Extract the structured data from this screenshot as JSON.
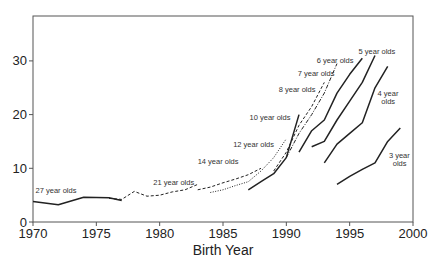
{
  "chart_data": {
    "type": "line",
    "title": "",
    "xlabel": "Birth Year",
    "ylabel": "",
    "xlim": [
      1970,
      2000
    ],
    "ylim": [
      0,
      38
    ],
    "xticks": [
      1970,
      1975,
      1980,
      1985,
      1990,
      1995,
      2000
    ],
    "yticks": [
      0,
      10,
      20,
      30
    ],
    "grid": false,
    "legend": "inline labels",
    "series": [
      {
        "name": "27 year olds",
        "style": "solid",
        "x": [
          1970,
          1972,
          1974,
          1976,
          1977
        ],
        "values": [
          3.8,
          3.2,
          4.6,
          4.5,
          4.0
        ]
      },
      {
        "name": "21 year olds",
        "style": "dashed",
        "x": [
          1976,
          1977,
          1978,
          1979,
          1980,
          1981,
          1982,
          1983
        ],
        "values": [
          4.4,
          4.2,
          5.7,
          4.8,
          5.0,
          5.6,
          6.0,
          7.0
        ]
      },
      {
        "name": "14 year olds",
        "style": "dashed",
        "x": [
          1983,
          1984,
          1985,
          1986,
          1987,
          1988
        ],
        "values": [
          6.0,
          6.5,
          7.3,
          8.0,
          8.8,
          10.0
        ]
      },
      {
        "name": "12 year olds",
        "style": "dotted",
        "x": [
          1984,
          1985,
          1986,
          1987,
          1988,
          1989,
          1990
        ],
        "values": [
          5.5,
          6.0,
          6.8,
          7.5,
          9.5,
          12.0,
          15.5
        ]
      },
      {
        "name": "10 year olds",
        "style": "solid",
        "x": [
          1987,
          1988,
          1989,
          1990,
          1991
        ],
        "values": [
          6.0,
          7.5,
          9.0,
          12.0,
          20.0
        ]
      },
      {
        "name": "8 year olds",
        "style": "dashed",
        "x": [
          1989,
          1990,
          1991,
          1992,
          1993
        ],
        "values": [
          9.5,
          13.0,
          18.0,
          21.5,
          26.0
        ]
      },
      {
        "name": "7 year olds",
        "style": "dash-dot",
        "x": [
          1990,
          1991,
          1992,
          1993,
          1994
        ],
        "values": [
          12.0,
          16.5,
          20.0,
          24.0,
          29.5
        ]
      },
      {
        "name": "6 year olds",
        "style": "solid",
        "x": [
          1991,
          1992,
          1993,
          1994,
          1995,
          1996
        ],
        "values": [
          13.0,
          17.0,
          19.0,
          24.0,
          27.5,
          30.5
        ]
      },
      {
        "name": "5 year olds",
        "style": "solid",
        "x": [
          1992,
          1993,
          1994,
          1995,
          1996,
          1997
        ],
        "values": [
          14.0,
          15.0,
          19.0,
          22.5,
          26.0,
          31.0
        ]
      },
      {
        "name": "4 year olds",
        "style": "solid",
        "x": [
          1993,
          1994,
          1995,
          1996,
          1997,
          1998
        ],
        "values": [
          11.0,
          14.5,
          16.5,
          18.5,
          25.0,
          29.0
        ]
      },
      {
        "name": "3 year olds",
        "style": "solid",
        "x": [
          1994,
          1995,
          1996,
          1997,
          1998,
          1999
        ],
        "values": [
          7.0,
          8.5,
          9.8,
          11.0,
          15.0,
          17.5
        ]
      }
    ],
    "annotations": [
      {
        "text": "27 year olds",
        "x": 1970.2,
        "y": 5.4
      },
      {
        "text": "21 year olds",
        "x": 1979.5,
        "y": 6.8
      },
      {
        "text": "14 year olds",
        "x": 1983.0,
        "y": 10.8
      },
      {
        "text": "12 year olds",
        "x": 1985.8,
        "y": 13.9
      },
      {
        "text": "10 year olds",
        "x": 1987.1,
        "y": 19.0
      },
      {
        "text": "8 year olds",
        "x": 1989.4,
        "y": 24.2
      },
      {
        "text": "7 year olds",
        "x": 1990.9,
        "y": 27.2
      },
      {
        "text": "6 year olds",
        "x": 1992.4,
        "y": 29.7
      },
      {
        "text": "5 year olds",
        "x": 1995.7,
        "y": 31.3
      },
      {
        "text": "4 year",
        "x": 1997.2,
        "y": 23.4
      },
      {
        "text": "olds",
        "x": 1997.5,
        "y": 21.9
      },
      {
        "text": "3 year",
        "x": 1998.1,
        "y": 12.0
      },
      {
        "text": "olds",
        "x": 1998.4,
        "y": 10.5
      }
    ]
  }
}
